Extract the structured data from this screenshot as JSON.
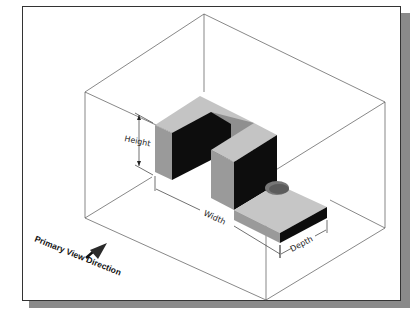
{
  "figure": {
    "type": "isometric-drawing",
    "labels": {
      "height": "Height",
      "width": "Width",
      "depth": "Depth",
      "view_direction": "Primary View Direction"
    },
    "colors": {
      "top_face": "#c4c4c4",
      "front_face": "#9a9a9a",
      "side_face": "#0d0d0d",
      "box_lines": "#555555",
      "shadow": "#8a8a8a"
    }
  }
}
